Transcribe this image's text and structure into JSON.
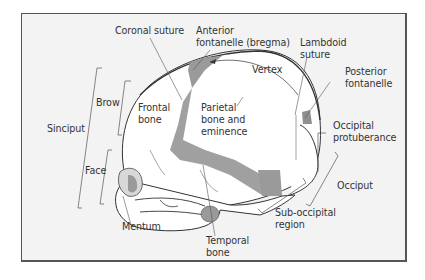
{
  "figure": {
    "colors": {
      "background": "#f3f3f3",
      "border": "#555555",
      "bone_fill": "#ffffff",
      "fontanelle_fill": "#9a9a9a",
      "line": "#333333"
    },
    "labels": {
      "coronal_suture": "Coronal suture",
      "anterior_fontanelle_1": "Anterior",
      "anterior_fontanelle_2": "fontanelle (bregma)",
      "lambdoid_suture_1": "Lambdoid",
      "lambdoid_suture_2": "suture",
      "vertex": "Vertex",
      "posterior_fontanelle_1": "Posterior",
      "posterior_fontanelle_2": "fontanelle",
      "brow": "Brow",
      "frontal_bone_1": "Frontal",
      "frontal_bone_2": "bone",
      "parietal_1": "Parietal",
      "parietal_2": "bone and",
      "parietal_3": "eminence",
      "sinciput": "Sinciput",
      "face": "Face",
      "occipital_protuberance_1": "Occipital",
      "occipital_protuberance_2": "protuberance",
      "occiput": "Occiput",
      "mentum": "Mentum",
      "temporal_bone_1": "Temporal",
      "temporal_bone_2": "bone",
      "sub_occipital_1": "Sub-occipital",
      "sub_occipital_2": "region"
    }
  }
}
